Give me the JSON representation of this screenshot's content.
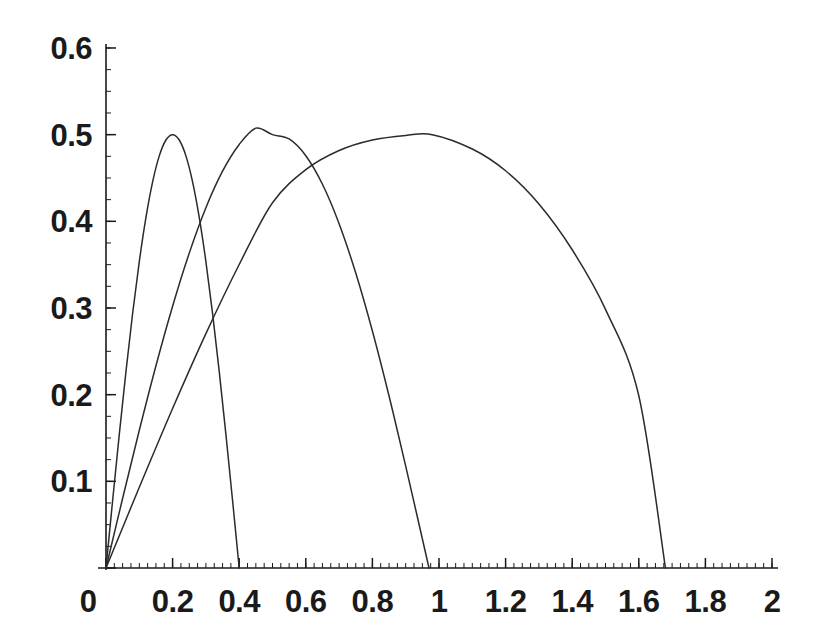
{
  "chart_data": {
    "type": "line",
    "title": "",
    "subtitle": "",
    "xlabel": "",
    "ylabel": "",
    "xlim": [
      0,
      2
    ],
    "ylim": [
      0,
      0.6
    ],
    "grid": false,
    "legend": null,
    "background_color": "#ffffff",
    "line_color": "#2b2b2b",
    "axis_color": "#1a1a1a",
    "x_ticks": [
      {
        "value": 0,
        "label": "0"
      },
      {
        "value": 0.2,
        "label": "0.2"
      },
      {
        "value": 0.4,
        "label": "0.4"
      },
      {
        "value": 0.6,
        "label": "0.6"
      },
      {
        "value": 0.8,
        "label": "0.8"
      },
      {
        "value": 1,
        "label": "1"
      },
      {
        "value": 1.2,
        "label": "1.2"
      },
      {
        "value": 1.4,
        "label": "1.4"
      },
      {
        "value": 1.6,
        "label": "1.6"
      },
      {
        "value": 1.8,
        "label": "1.8"
      },
      {
        "value": 2,
        "label": "2"
      }
    ],
    "y_ticks": [
      {
        "value": 0,
        "label": "0"
      },
      {
        "value": 0.1,
        "label": "0.1"
      },
      {
        "value": 0.2,
        "label": "0.2"
      },
      {
        "value": 0.3,
        "label": "0.3"
      },
      {
        "value": 0.4,
        "label": "0.4"
      },
      {
        "value": 0.5,
        "label": "0.5"
      },
      {
        "value": 0.6,
        "label": "0.6"
      }
    ],
    "x_minor_tick_step": 0.025,
    "y_minor_tick_step": 0.025,
    "series": [
      {
        "name": "curve-1",
        "peak_x": 0.2,
        "peak_y": 0.5,
        "x_start": 0.0,
        "x_end": 0.4,
        "skew": 1.0,
        "points_x": [
          0.0,
          0.02,
          0.04,
          0.06,
          0.08,
          0.1,
          0.12,
          0.14,
          0.16,
          0.18,
          0.2,
          0.22,
          0.24,
          0.26,
          0.28,
          0.3,
          0.32,
          0.34,
          0.36,
          0.38,
          0.4
        ],
        "points_y": [
          0.0,
          0.0782,
          0.1545,
          0.2269,
          0.2939,
          0.3536,
          0.4045,
          0.4455,
          0.4755,
          0.4938,
          0.5,
          0.4938,
          0.4755,
          0.4455,
          0.4045,
          0.3536,
          0.2939,
          0.2269,
          0.1545,
          0.0782,
          0.0
        ]
      },
      {
        "name": "curve-2",
        "peak_x": 0.5,
        "peak_y": 0.5,
        "x_start": 0.0,
        "x_end": 0.97,
        "skew": 1.0,
        "points_x": [
          0.0,
          0.05,
          0.1,
          0.15,
          0.2,
          0.25,
          0.3,
          0.35,
          0.4,
          0.45,
          0.5,
          0.55,
          0.6,
          0.65,
          0.7,
          0.75,
          0.8,
          0.85,
          0.9,
          0.97
        ],
        "points_y": [
          0.0,
          0.0805,
          0.1589,
          0.2334,
          0.3021,
          0.3633,
          0.4157,
          0.4578,
          0.4887,
          0.5075,
          0.5,
          0.495,
          0.4757,
          0.4428,
          0.3973,
          0.3403,
          0.2734,
          0.1984,
          0.1175,
          0.0
        ]
      },
      {
        "name": "curve-3",
        "peak_x": 0.98,
        "peak_y": 0.5,
        "x_start": 0.0,
        "x_end": 1.68,
        "skew": 1.0,
        "points_x": [
          0.0,
          0.1,
          0.2,
          0.3,
          0.4,
          0.5,
          0.6,
          0.7,
          0.8,
          0.9,
          0.98,
          1.1,
          1.2,
          1.3,
          1.4,
          1.5,
          1.6,
          1.68
        ],
        "points_y": [
          0.0,
          0.0931,
          0.184,
          0.2704,
          0.3502,
          0.4214,
          0.4596,
          0.4817,
          0.4938,
          0.4991,
          0.5,
          0.4834,
          0.4583,
          0.42,
          0.3672,
          0.2984,
          0.1987,
          0.0
        ]
      }
    ]
  }
}
